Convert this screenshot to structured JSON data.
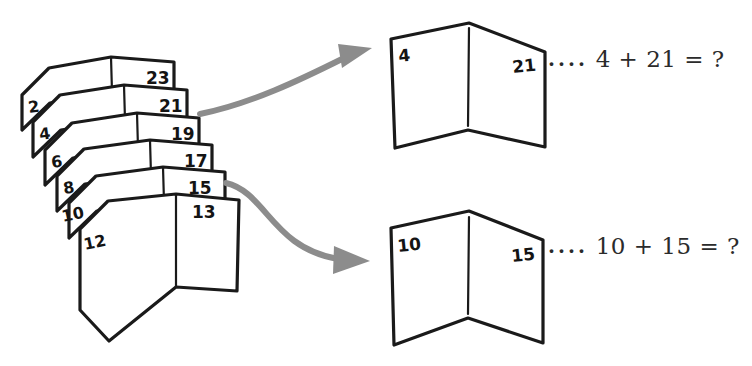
{
  "figure": {
    "kind": "hand-drawn-illustration",
    "ink_color": "#1a1a1a",
    "paper_color": "#ffffff",
    "arrow_color": "#8c8c8c"
  },
  "stack": {
    "name": "booklet-stack",
    "count": 6,
    "booklets": [
      {
        "left": "2",
        "right": "23"
      },
      {
        "left": "4",
        "right": "21"
      },
      {
        "left": "6",
        "right": "19"
      },
      {
        "left": "8",
        "right": "17"
      },
      {
        "left": "10",
        "right": "15"
      },
      {
        "left": "12",
        "right": "13"
      }
    ]
  },
  "arrows": [
    {
      "name": "arrow-to-top-booklet",
      "from": "stack",
      "to": "top-booklet"
    },
    {
      "name": "arrow-to-bottom-booklet",
      "from": "stack",
      "to": "bottom-booklet"
    }
  ],
  "callouts": [
    {
      "name": "top-callout",
      "booklet": {
        "left": "4",
        "right": "21"
      },
      "dots": "....",
      "equation": "4 + 21 = ?"
    },
    {
      "name": "bottom-callout",
      "booklet": {
        "left": "10",
        "right": "15"
      },
      "dots": "....",
      "equation": "10 + 15 = ?"
    }
  ]
}
